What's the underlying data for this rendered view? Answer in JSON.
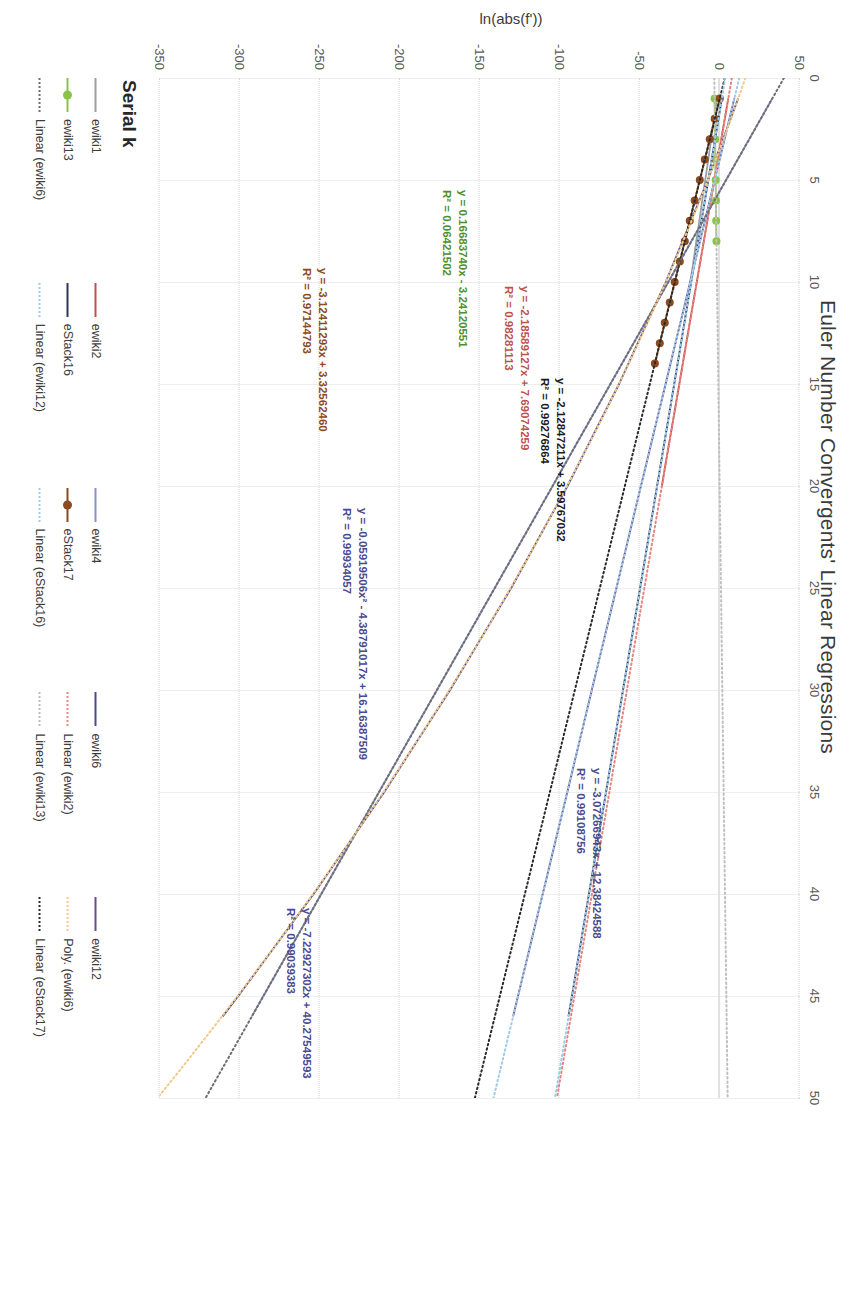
{
  "chart": {
    "title": "Euler Number Convergents' Linear Regressions",
    "ylabel": "ln(abs(f'))",
    "xlabel": ""
  },
  "legend": {
    "title": "Serial k",
    "items": [
      {
        "label": "ewiki1",
        "color": "#9aa0a6",
        "style": "solid",
        "marker": false
      },
      {
        "label": "ewiki2",
        "color": "#c0504d",
        "style": "solid",
        "marker": false
      },
      {
        "label": "ewiki4",
        "color": "#8891c7",
        "style": "solid",
        "marker": false
      },
      {
        "label": "ewiki6",
        "color": "#4a4a8c",
        "style": "solid",
        "marker": false
      },
      {
        "label": "ewiki12",
        "color": "#6e4b87",
        "style": "solid",
        "marker": false
      },
      {
        "label": "ewiki13",
        "color": "#8bc34a",
        "style": "solid",
        "marker": true
      },
      {
        "label": "eStack16",
        "color": "#2f3556",
        "style": "solid",
        "marker": false
      },
      {
        "label": "eStack17",
        "color": "#8b4a20",
        "style": "solid",
        "marker": true
      },
      {
        "label": "Linear (ewiki2)",
        "color": "#e8837e",
        "style": "dotted",
        "marker": false
      },
      {
        "label": "Poly. (ewiki6)",
        "color": "#f3c98b",
        "style": "dotted",
        "marker": false
      },
      {
        "label": "Linear (ewiki6)",
        "color": "#6f6f6f",
        "style": "dotted",
        "marker": false
      },
      {
        "label": "Linear (ewiki12)",
        "color": "#9ecbe8",
        "style": "dotted",
        "marker": false
      },
      {
        "label": "Linear (eStack16)",
        "color": "#9ecbe8",
        "style": "dotted",
        "marker": false
      },
      {
        "label": "Linear (ewiki13)",
        "color": "#bfbfbf",
        "style": "dotted",
        "marker": false
      },
      {
        "label": "Linear (eStack17)",
        "color": "#2a2a2a",
        "style": "dotted",
        "marker": false
      }
    ]
  },
  "annotations": [
    {
      "id": "ewiki13-fit",
      "equation": "y = 0.16683740x - 3.24120551",
      "r2": "R² = 0.06421502",
      "color": "#4e8f2a",
      "x": 112,
      "y": 330,
      "align": "left"
    },
    {
      "id": "ewiki2-fit",
      "equation": "y = -2.18589127x + 7.69074259",
      "r2": "R² = 0.98281113",
      "color": "#c0504d",
      "x": 208,
      "y": 268,
      "align": "left"
    },
    {
      "id": "eStack17-fit",
      "equation": "y = -3.12411293x + 3.32562460",
      "r2": "R² = 0.97144793",
      "color": "#8b4a20",
      "x": 190,
      "y": 470,
      "align": "left"
    },
    {
      "id": "eStack16-fit",
      "equation": "y = -2.12847211x + 3.59767032",
      "r2": "R² = 0.99276864",
      "color": "#1a1a1a",
      "x": 300,
      "y": 232,
      "align": "left"
    },
    {
      "id": "ewiki6-poly",
      "equation": "y = -0.05919506x² - 4.38791017x + 16.16387509",
      "r2": "R² = 0.99934057",
      "color": "#4a4a8c",
      "x": 430,
      "y": 430,
      "align": "left"
    },
    {
      "id": "ewiki12-fit",
      "equation": "y = -3.07266943x + 12.38424588",
      "r2": "R² = 0.99108756",
      "color": "#4a4a8c",
      "x": 690,
      "y": 196,
      "align": "left"
    },
    {
      "id": "ewiki4-fit",
      "equation": "y = -7.22927302x + 40.27549593",
      "r2": "R² = 0.99039383",
      "color": "#4a4a8c",
      "x": 830,
      "y": 486,
      "align": "left"
    }
  ],
  "chart_data": {
    "type": "scatter",
    "title": "Euler Number Convergents' Linear Regressions",
    "xlabel": "",
    "ylabel": "ln(abs(f'))",
    "grid": true,
    "legend_position": "bottom",
    "legend_title": "Serial k",
    "xlim": [
      0,
      50
    ],
    "ylim": [
      -350,
      50
    ],
    "xticks": [
      0,
      5,
      10,
      15,
      20,
      25,
      30,
      35,
      40,
      45,
      50
    ],
    "xtick_labels": [
      "0",
      "5",
      "10",
      "15",
      "20",
      "25",
      "30",
      "35",
      "40",
      "45",
      "50"
    ],
    "yticks": [
      50,
      0,
      -50,
      -100,
      -150,
      -200,
      -250,
      -300,
      -350
    ],
    "ytick_labels": [
      "50",
      "0",
      "-50",
      "-100",
      "-150",
      "-200",
      "-250",
      "-300",
      "-350"
    ],
    "series": [
      {
        "name": "ewiki1",
        "color": "#9aa0a6",
        "type": "line",
        "x": [
          1,
          2,
          3,
          4,
          5,
          6,
          7,
          8,
          9,
          10
        ],
        "y": [
          -1.5,
          -3.3,
          -5.2,
          -7.0,
          -8.9,
          -10.8,
          -12.6,
          -14.5,
          -16.3,
          -18.2
        ]
      },
      {
        "name": "ewiki2",
        "color": "#c0504d",
        "type": "line",
        "x": [
          1,
          3,
          5,
          7,
          9,
          11,
          13,
          15,
          17,
          19,
          20
        ],
        "y": [
          5.5,
          1.1,
          -3.2,
          -7.6,
          -12.0,
          -16.4,
          -20.8,
          -25.1,
          -29.5,
          -33.9,
          -36.0
        ]
      },
      {
        "name": "ewiki4",
        "color": "#8891c7",
        "type": "line",
        "x": [
          1,
          5,
          10,
          15,
          20,
          25,
          30,
          35,
          40,
          45,
          46
        ],
        "y": [
          33.0,
          4.1,
          -32.0,
          -68.2,
          -104.3,
          -140.5,
          -176.6,
          -212.8,
          -248.9,
          -285.1,
          -292.3
        ]
      },
      {
        "name": "ewiki6",
        "color": "#4a4a8c",
        "type": "line",
        "x": [
          1,
          5,
          10,
          15,
          20,
          25,
          30,
          35,
          40,
          45,
          46
        ],
        "y": [
          11.7,
          -7.3,
          -33.6,
          -62.8,
          -95.0,
          -130.2,
          -168.4,
          -209.5,
          -253.7,
          -300.8,
          -310.5
        ]
      },
      {
        "name": "ewiki12",
        "color": "#6e4b87",
        "type": "line",
        "x": [
          1,
          5,
          10,
          15,
          20,
          25,
          30,
          35,
          40,
          45,
          46
        ],
        "y": [
          9.3,
          -3.0,
          -18.3,
          -33.7,
          -49.1,
          -64.4,
          -79.8,
          -95.1,
          -110.5,
          -125.9,
          -129.0
        ]
      },
      {
        "name": "ewiki13",
        "color": "#8bc34a",
        "type": "scatter-line",
        "x": [
          1,
          2,
          3,
          4,
          5,
          6,
          7,
          8
        ],
        "y": [
          -3.1,
          -2.9,
          -2.7,
          -2.6,
          -2.4,
          -2.2,
          -2.1,
          -1.9
        ]
      },
      {
        "name": "eStack16",
        "color": "#2f3556",
        "type": "line",
        "x": [
          1,
          5,
          10,
          15,
          20,
          25,
          30,
          35,
          40,
          45,
          46
        ],
        "y": [
          1.5,
          -7.0,
          -17.7,
          -28.3,
          -39.0,
          -49.6,
          -60.3,
          -70.9,
          -81.6,
          -92.2,
          -94.4
        ]
      },
      {
        "name": "eStack17",
        "color": "#8b4a20",
        "type": "scatter-line",
        "x": [
          1,
          2,
          3,
          4,
          5,
          6,
          7,
          8,
          9,
          10,
          11,
          12,
          13,
          14
        ],
        "y": [
          0.2,
          -3.0,
          -6.1,
          -9.2,
          -12.3,
          -15.5,
          -18.6,
          -21.7,
          -24.8,
          -28.0,
          -31.1,
          -34.2,
          -37.3,
          -40.4
        ]
      }
    ],
    "fits": [
      {
        "name": "Linear (ewiki13)",
        "slope": 0.1668374,
        "intercept": -3.24120551,
        "r2": 0.06421502,
        "color": "#bfbfbf"
      },
      {
        "name": "Linear (ewiki2)",
        "slope": -2.18589127,
        "intercept": 7.69074259,
        "r2": 0.98281113,
        "color": "#e8837e"
      },
      {
        "name": "Linear (eStack17)",
        "slope": -3.12411293,
        "intercept": 3.3256246,
        "r2": 0.97144793,
        "color": "#2a2a2a"
      },
      {
        "name": "Linear (eStack16)",
        "slope": -2.12847211,
        "intercept": 3.59767032,
        "r2": 0.99276864,
        "color": "#9ecbe8"
      },
      {
        "name": "Linear (ewiki12)",
        "slope": -3.07266943,
        "intercept": 12.38424588,
        "r2": 0.99108756,
        "color": "#9ecbe8"
      },
      {
        "name": "Linear (ewiki6)",
        "slope": -7.22927302,
        "intercept": 40.27549593,
        "r2": 0.99039383,
        "color": "#6f6f6f"
      },
      {
        "name": "Poly. (ewiki6)",
        "a": -0.05919506,
        "b": -4.38791017,
        "c": 16.16387509,
        "r2": 0.99934057,
        "color": "#f3c98b"
      }
    ]
  }
}
